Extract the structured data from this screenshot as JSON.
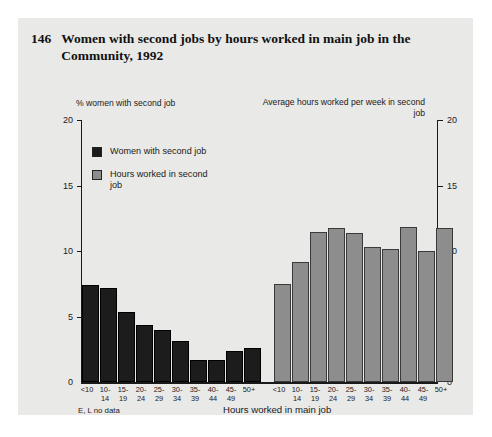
{
  "figure": {
    "number": "146",
    "title": "Women with second jobs by hours worked in main job in the Community, 1992"
  },
  "left_axis": {
    "caption": "% women with second job",
    "ticks": [
      "20",
      "15",
      "10",
      "5",
      "0"
    ]
  },
  "right_axis": {
    "caption": "Average hours worked per week in second job",
    "ticks": [
      "20",
      "15",
      "10",
      "5",
      "0"
    ]
  },
  "legend": {
    "items": [
      {
        "label": "Women with second job",
        "color": "#1c1c1c",
        "swatch": "dark"
      },
      {
        "label": "Hours worked in second job",
        "color": "#8d8d8d",
        "swatch": "gray"
      }
    ]
  },
  "xaxis": {
    "title": "Hours worked in main job",
    "footnote": "E, L no data"
  },
  "chart_data": {
    "type": "bar",
    "title": "Women with second jobs by hours worked in main job in the Community, 1992",
    "xlabel": "Hours worked in main job",
    "ylabel": "% women with second job",
    "y2label": "Average hours worked per week in second job",
    "ylim": [
      0,
      20
    ],
    "y2lim": [
      0,
      20
    ],
    "yticks": [
      0,
      5,
      10,
      15,
      20
    ],
    "grid": false,
    "legend_position": "upper-left",
    "categories": [
      "<10",
      "10-14",
      "15-19",
      "20-24",
      "25-29",
      "30-34",
      "35-39",
      "40-44",
      "45-49",
      "50+"
    ],
    "category_lines": [
      [
        "<10",
        ""
      ],
      [
        "10-",
        "14"
      ],
      [
        "15-",
        "19"
      ],
      [
        "20-",
        "24"
      ],
      [
        "25-",
        "29"
      ],
      [
        "30-",
        "34"
      ],
      [
        "35-",
        "39"
      ],
      [
        "40-",
        "44"
      ],
      [
        "45-",
        "49"
      ],
      [
        "50+",
        ""
      ]
    ],
    "series": [
      {
        "name": "Women with second job",
        "axis": "left",
        "unit": "%",
        "color": "#1c1c1c",
        "values": [
          7.4,
          7.2,
          5.4,
          4.4,
          4.0,
          3.2,
          1.7,
          1.7,
          2.4,
          2.6
        ]
      },
      {
        "name": "Hours worked in second job",
        "axis": "right",
        "unit": "hours per week",
        "color": "#8d8d8d",
        "values": [
          7.5,
          9.2,
          11.5,
          11.8,
          11.4,
          10.3,
          10.2,
          11.9,
          10.0,
          11.8
        ]
      }
    ],
    "annotations": [
      "E, L no data"
    ]
  },
  "colors": {
    "panel_background": "#e9e9e7",
    "page_background": "#ffffff",
    "axis": "#1a1a1a",
    "series_dark": "#1c1c1c",
    "series_gray": "#8d8d8d"
  }
}
